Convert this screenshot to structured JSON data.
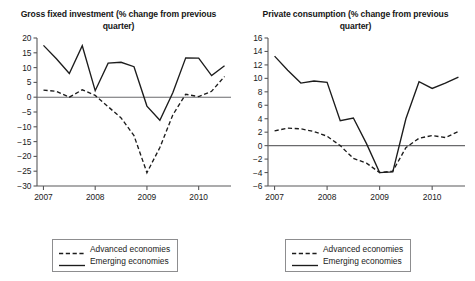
{
  "legend": {
    "entries": [
      {
        "label": "Advanced economies",
        "style": "dashed",
        "key_icon": "dashed-line-icon"
      },
      {
        "label": "Emerging economies",
        "style": "solid",
        "key_icon": "solid-line-icon"
      }
    ]
  },
  "chart_data": [
    {
      "type": "line",
      "title": "Gross fixed investment (% change from previous quarter)",
      "xlabel": "",
      "ylabel": "",
      "grid": false,
      "legend_position": "bottom",
      "ylim": [
        -30,
        20
      ],
      "yticks": [
        20,
        15,
        10,
        5,
        0,
        -5,
        -10,
        -15,
        -20,
        -25,
        -30
      ],
      "ytick_labels": [
        "20",
        "15",
        "10",
        "5",
        "0",
        "-5",
        "-10",
        "-15",
        "-20",
        "-25",
        "-30"
      ],
      "xlim": [
        2006.875,
        2010.625
      ],
      "xticks": [
        2007,
        2008,
        2009,
        2010
      ],
      "xtick_labels": [
        "2007",
        "2008",
        "2009",
        "2010"
      ],
      "x": [
        2007.0,
        2007.25,
        2007.5,
        2007.75,
        2008.0,
        2008.25,
        2008.5,
        2008.75,
        2009.0,
        2009.25,
        2009.5,
        2009.75,
        2010.0,
        2010.25,
        2010.5
      ],
      "series": [
        {
          "name": "Emerging economies",
          "style": "solid",
          "values": [
            17.5,
            13.0,
            8.0,
            17.4,
            2.2,
            11.5,
            11.8,
            10.3,
            -3.0,
            -7.8,
            1.5,
            13.3,
            13.2,
            7.3,
            10.6
          ]
        },
        {
          "name": "Advanced economies",
          "style": "dashed",
          "values": [
            2.4,
            2.0,
            0.0,
            2.5,
            0.6,
            -3.2,
            -7.0,
            -13.0,
            -25.5,
            -17.0,
            -6.0,
            1.0,
            0.2,
            2.0,
            7.0
          ]
        }
      ]
    },
    {
      "type": "line",
      "title": "Private consumption (% change from previous quarter)",
      "xlabel": "",
      "ylabel": "",
      "grid": false,
      "legend_position": "bottom",
      "ylim": [
        -6,
        16
      ],
      "yticks": [
        16,
        14,
        12,
        10,
        8,
        6,
        4,
        2,
        0,
        -2,
        -4,
        -6
      ],
      "ytick_labels": [
        "16",
        "14",
        "12",
        "10",
        "8",
        "6",
        "4",
        "2",
        "0",
        "-2",
        "-4",
        "-6"
      ],
      "xlim": [
        2006.875,
        2010.625
      ],
      "xticks": [
        2007,
        2008,
        2009,
        2010
      ],
      "xtick_labels": [
        "2007",
        "2008",
        "2009",
        "2010"
      ],
      "x": [
        2007.0,
        2007.25,
        2007.5,
        2007.75,
        2008.0,
        2008.25,
        2008.5,
        2008.75,
        2009.0,
        2009.25,
        2009.5,
        2009.75,
        2010.0,
        2010.25,
        2010.5
      ],
      "series": [
        {
          "name": "Emerging economies",
          "style": "solid",
          "values": [
            13.3,
            11.2,
            9.3,
            9.6,
            9.4,
            3.7,
            4.1,
            0.3,
            -4.0,
            -3.9,
            4.0,
            9.5,
            8.5,
            9.3,
            10.2
          ]
        },
        {
          "name": "Advanced economies",
          "style": "dashed",
          "values": [
            2.2,
            2.6,
            2.5,
            2.1,
            1.4,
            0.0,
            -1.9,
            -2.6,
            -4.0,
            -3.8,
            -0.3,
            1.1,
            1.5,
            1.2,
            2.1
          ]
        }
      ]
    }
  ]
}
